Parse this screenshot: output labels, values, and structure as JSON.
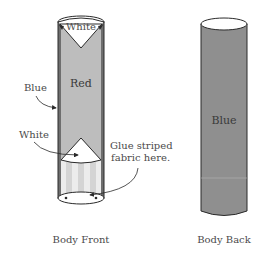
{
  "diagram": {
    "front": {
      "caption": "Body Front",
      "labels": {
        "top_cap": "White",
        "body": "Red",
        "side_edge": "Blue",
        "lower_triangle": "White",
        "glue_note_line1": "Glue striped",
        "glue_note_line2": "fabric here."
      }
    },
    "back": {
      "caption": "Body Back",
      "labels": {
        "body": "Blue"
      }
    },
    "colors": {
      "outline": "#2a2a2a",
      "red_panel": "#bdbdbd",
      "blue_edge": "#6e6e6e",
      "white": "#ffffff",
      "stripe_light": "#ececec",
      "stripe_dark": "#cfcfcf",
      "back_body": "#8f8f8f",
      "text": "#4a4a4a"
    }
  }
}
